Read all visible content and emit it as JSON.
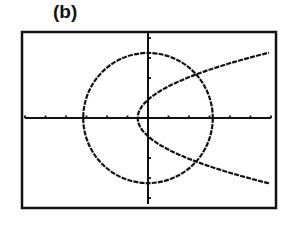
{
  "panel_label": "(b)",
  "chart_data": {
    "type": "line",
    "title": "(b)",
    "xlabel": "",
    "ylabel": "",
    "xlim": [
      -6,
      6
    ],
    "ylim": [
      -4.3,
      4.3
    ],
    "x_tick_step": 1,
    "y_tick_step": 1,
    "grid": false,
    "legend": null,
    "series": [
      {
        "name": "circle",
        "equation": "x^2 + y^2 = 10",
        "shape": "circle",
        "center": [
          0,
          0
        ],
        "radius": 3.16
      },
      {
        "name": "parabola",
        "equation": "x = 0.6y^2 - 0.5",
        "shape": "sideways-parabola",
        "vertex": [
          -0.5,
          0
        ]
      }
    ],
    "intersections": [
      [
        2.4,
        2.2
      ],
      [
        2.4,
        -2.2
      ]
    ],
    "colors": {
      "curve": "#111111",
      "axis": "#111111",
      "frame": "#111111",
      "background": "#ffffff"
    }
  }
}
